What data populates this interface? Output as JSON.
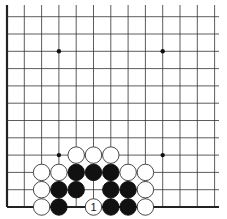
{
  "board": {
    "description": "Go problem diagram, lower-left corner section of board",
    "columns_visible": 13,
    "rows_visible": 12,
    "grid_spacing_px": 17.3,
    "origin_px": {
      "x": 7,
      "y": 207
    },
    "edges": {
      "left": true,
      "bottom": true,
      "top": false,
      "right": false
    },
    "line_color": "#333333",
    "edge_color": "#222222",
    "star_points": [
      {
        "col": 3,
        "row": 9
      },
      {
        "col": 9,
        "row": 9
      },
      {
        "col": 3,
        "row": 3
      },
      {
        "col": 9,
        "row": 3
      }
    ]
  },
  "stones": [
    {
      "color": "white",
      "col": 4,
      "row": 3
    },
    {
      "color": "white",
      "col": 5,
      "row": 3
    },
    {
      "color": "white",
      "col": 6,
      "row": 3
    },
    {
      "color": "white",
      "col": 2,
      "row": 2
    },
    {
      "color": "white",
      "col": 3,
      "row": 2
    },
    {
      "color": "black",
      "col": 4,
      "row": 2
    },
    {
      "color": "black",
      "col": 5,
      "row": 2
    },
    {
      "color": "black",
      "col": 6,
      "row": 2
    },
    {
      "color": "white",
      "col": 7,
      "row": 2
    },
    {
      "color": "white",
      "col": 8,
      "row": 2
    },
    {
      "color": "white",
      "col": 2,
      "row": 1
    },
    {
      "color": "black",
      "col": 3,
      "row": 1
    },
    {
      "color": "black",
      "col": 4,
      "row": 1
    },
    {
      "color": "black",
      "col": 6,
      "row": 1
    },
    {
      "color": "black",
      "col": 7,
      "row": 1
    },
    {
      "color": "white",
      "col": 8,
      "row": 1
    },
    {
      "color": "white",
      "col": 2,
      "row": 0
    },
    {
      "color": "black",
      "col": 3,
      "row": 0
    },
    {
      "color": "white",
      "col": 5,
      "row": 0,
      "label": "1"
    },
    {
      "color": "black",
      "col": 6,
      "row": 0
    },
    {
      "color": "black",
      "col": 7,
      "row": 0
    },
    {
      "color": "white",
      "col": 8,
      "row": 0
    }
  ],
  "colors": {
    "black_stone": "#111111",
    "white_stone_fill": "#ffffff",
    "white_stone_stroke": "#333333",
    "background": "#ffffff"
  }
}
